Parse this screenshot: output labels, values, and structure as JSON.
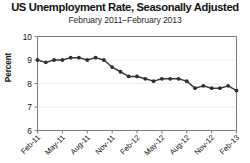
{
  "chart_data": {
    "type": "line",
    "title": "US Unemployment Rate, Seasonally Adjusted",
    "subtitle": "February 2011–February 2013",
    "xlabel": "",
    "ylabel": "Percent",
    "ylim": [
      6,
      10
    ],
    "ytick_values": [
      6,
      7,
      8,
      9,
      10
    ],
    "ytick_labels": [
      "6",
      "7",
      "8",
      "9",
      "10"
    ],
    "grid": true,
    "legend": null,
    "series_color": "#2e2e2e",
    "markers": true,
    "xtick_labels": [
      "Feb-11",
      "May-11",
      "Aug-11",
      "Nov-11",
      "Feb-12",
      "May-12",
      "Aug-12",
      "Nov-12",
      "Feb-13"
    ],
    "xtick_indices": [
      0,
      3,
      6,
      9,
      12,
      15,
      18,
      21,
      24
    ],
    "x": [
      "Feb-11",
      "Mar-11",
      "Apr-11",
      "May-11",
      "Jun-11",
      "Jul-11",
      "Aug-11",
      "Sep-11",
      "Oct-11",
      "Nov-11",
      "Dec-11",
      "Jan-12",
      "Feb-12",
      "Mar-12",
      "Apr-12",
      "May-12",
      "Jun-12",
      "Jul-12",
      "Aug-12",
      "Sep-12",
      "Oct-12",
      "Nov-12",
      "Dec-12",
      "Jan-13",
      "Feb-13"
    ],
    "values": [
      9.0,
      8.9,
      9.0,
      9.0,
      9.1,
      9.1,
      9.0,
      9.1,
      9.0,
      8.7,
      8.5,
      8.3,
      8.3,
      8.2,
      8.1,
      8.2,
      8.2,
      8.2,
      8.1,
      7.8,
      7.9,
      7.8,
      7.8,
      7.9,
      7.7
    ],
    "series": [
      {
        "name": "US Unemployment Rate",
        "values": [
          9.0,
          8.9,
          9.0,
          9.0,
          9.1,
          9.1,
          9.0,
          9.1,
          9.0,
          8.7,
          8.5,
          8.3,
          8.3,
          8.2,
          8.1,
          8.2,
          8.2,
          8.2,
          8.1,
          7.8,
          7.9,
          7.8,
          7.8,
          7.9,
          7.7
        ]
      }
    ]
  }
}
